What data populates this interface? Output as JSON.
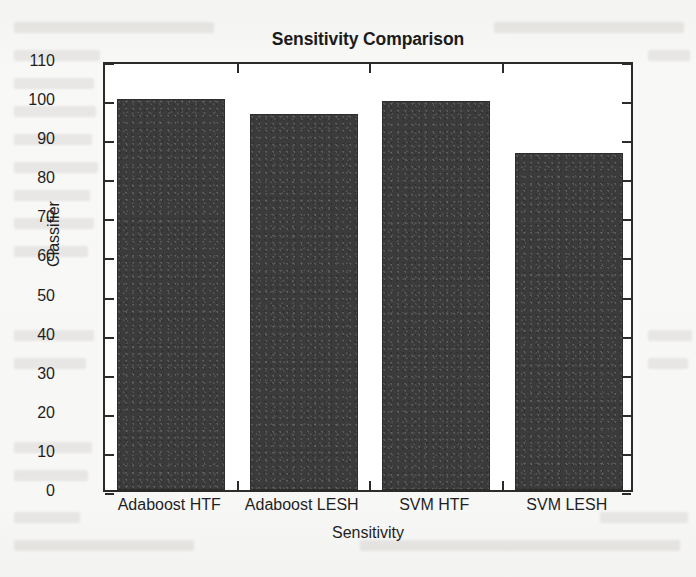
{
  "chart_data": {
    "type": "bar",
    "title": "Sensitivity Comparison",
    "xlabel": "Sensitivity",
    "ylabel": "Classifier",
    "categories": [
      "Adaboost HTF",
      "Adaboost LESH",
      "SVM HTF",
      "SVM LESH"
    ],
    "values": [
      100,
      96.3,
      99.6,
      86.3
    ],
    "ylim": [
      0,
      110
    ],
    "ytick_labels": [
      "0",
      "10",
      "20",
      "30",
      "40",
      "50",
      "60",
      "70",
      "80",
      "90",
      "100",
      "110"
    ],
    "ytick_values": [
      0,
      10,
      20,
      30,
      40,
      50,
      60,
      70,
      80,
      90,
      100,
      110
    ],
    "grid": false,
    "legend": "none",
    "bar_color": "#3b3b3b",
    "axis_color": "#2b2b2b",
    "plot_background": "#ffffff",
    "figure_background": "#f7f7f6"
  }
}
